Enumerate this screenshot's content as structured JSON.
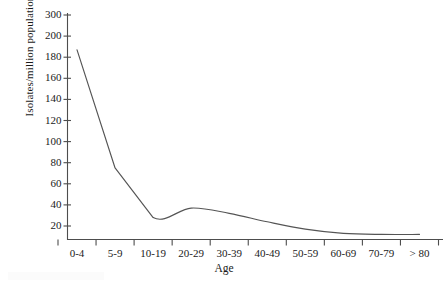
{
  "chart_data": {
    "type": "line",
    "title": "",
    "xlabel": "Age",
    "ylabel": "Isolates/million population",
    "categories": [
      "0-4",
      "5-9",
      "10-19",
      "20-29",
      "30-39",
      "40-49",
      "50-59",
      "60-69",
      "70-79",
      "> 80"
    ],
    "values": [
      187,
      75,
      28,
      37,
      32,
      24,
      17,
      13,
      12,
      12
    ],
    "yticks": [
      300,
      200,
      180,
      160,
      140,
      120,
      100,
      80,
      60,
      40,
      20
    ],
    "y_axis_break_between": [
      200,
      300
    ],
    "ylim": [
      0,
      300
    ],
    "grid": false,
    "legend": null,
    "series": [
      {
        "name": "Isolates/million population",
        "values": [
          187,
          75,
          28,
          37,
          32,
          24,
          17,
          13,
          12,
          12
        ]
      }
    ],
    "line_color": "#555555",
    "axis_color": "#4d4d4d"
  },
  "axis": {
    "y_tick_labels": [
      "300",
      "200",
      "180",
      "160",
      "140",
      "120",
      "100",
      "80",
      "60",
      "40",
      "20"
    ],
    "x_tick_labels": [
      "0-4",
      "5-9",
      "10-19",
      "20-29",
      "30-39",
      "40-49",
      "50-59",
      "60-69",
      "70-79",
      "> 80"
    ],
    "y_title": "Isolates/million population",
    "x_title": "Age"
  }
}
